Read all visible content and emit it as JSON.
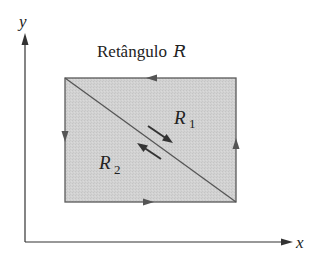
{
  "diagram": {
    "title": "Retângulo",
    "title_symbol": "R",
    "axes": {
      "x_label": "x",
      "y_label": "y"
    },
    "regions": [
      {
        "name": "R",
        "subscript": "1"
      },
      {
        "name": "R",
        "subscript": "2"
      }
    ],
    "colors": {
      "fill": "#d0d0d0",
      "stroke": "#555555",
      "axis": "#333333",
      "text": "#222222"
    }
  }
}
